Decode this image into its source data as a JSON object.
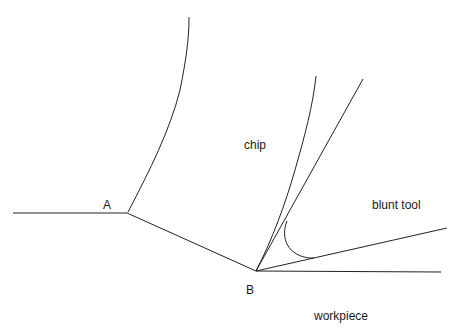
{
  "diagram": {
    "stroke_color": "#222222",
    "labels": {
      "A": "A",
      "B": "B",
      "chip": "chip",
      "blunt_tool": "blunt tool",
      "workpiece": "workpiece"
    },
    "points": {
      "A": [
        127,
        213
      ],
      "B": [
        256,
        271
      ]
    }
  }
}
